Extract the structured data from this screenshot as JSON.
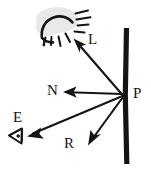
{
  "diagram": {
    "background_color": "#ffffff",
    "ink_color": "#141414",
    "glow_color": "#e9e9e9",
    "style": "hand-drawn sketch",
    "labels": {
      "light_vector": "L",
      "surface_point": "P",
      "normal_vector": "N",
      "eye_vector": "E",
      "reflection_vector": "R"
    },
    "icons": {
      "sun": "sun-icon",
      "eye": "eye-icon",
      "surface": "surface-line"
    },
    "vectors": [
      {
        "name": "L",
        "label": "L",
        "from": [
          123,
          95
        ],
        "to": [
          75,
          41
        ],
        "description": "incident light direction toward the sun"
      },
      {
        "name": "N",
        "label": "N",
        "from": [
          123,
          95
        ],
        "to": [
          64,
          92
        ],
        "description": "surface normal pointing left"
      },
      {
        "name": "E",
        "label": "E",
        "from": [
          123,
          95
        ],
        "to": [
          28,
          136
        ],
        "description": "eye / viewer direction"
      },
      {
        "name": "R",
        "label": "R",
        "from": [
          123,
          95
        ],
        "to": [
          88,
          144
        ],
        "description": "reflection direction"
      }
    ],
    "surface": {
      "name": "surface-line",
      "x": 126,
      "y_top": 28,
      "y_bottom": 164
    }
  }
}
